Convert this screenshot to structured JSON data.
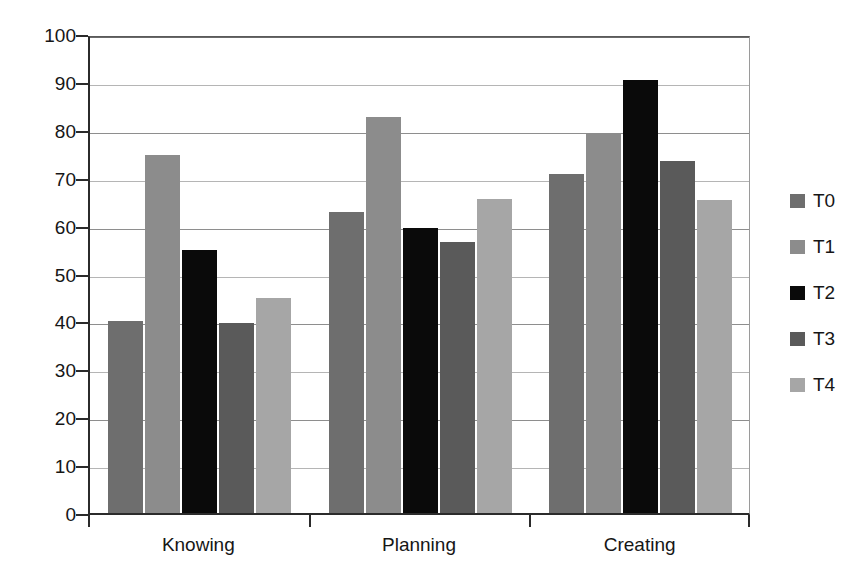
{
  "chart_data": {
    "type": "bar",
    "title": "",
    "subtitle": "",
    "xlabel": "",
    "ylabel": "",
    "categories": [
      "Knowing",
      "Planning",
      "Creating"
    ],
    "series": [
      {
        "name": "T0",
        "color": "#6e6e6e",
        "values": [
          40.0,
          62.8,
          70.7
        ]
      },
      {
        "name": "T1",
        "color": "#8c8c8c",
        "values": [
          74.8,
          82.6,
          79.4
        ]
      },
      {
        "name": "T2",
        "color": "#0a0a0a",
        "values": [
          54.9,
          59.6,
          90.5
        ]
      },
      {
        "name": "T3",
        "color": "#5a5a5a",
        "values": [
          39.6,
          56.6,
          73.4
        ]
      },
      {
        "name": "T4",
        "color": "#a6a6a6",
        "values": [
          44.8,
          65.6,
          65.4
        ]
      }
    ],
    "ylim": [
      0,
      100
    ],
    "ytick_labels": [
      "0",
      "10",
      "20",
      "30",
      "40",
      "50",
      "60",
      "70",
      "80",
      "90",
      "100"
    ],
    "ytick_values": [
      0,
      10,
      20,
      30,
      40,
      50,
      60,
      70,
      80,
      90,
      100
    ],
    "grid": true,
    "grid_axis": "y",
    "legend": {
      "position": "right",
      "entries": [
        "T0",
        "T1",
        "T2",
        "T3",
        "T4"
      ]
    }
  },
  "style": {
    "axis_color": "#2b2b2b",
    "grid_color": "#8e8e8e",
    "background": "#ffffff",
    "text_color": "#161616"
  }
}
